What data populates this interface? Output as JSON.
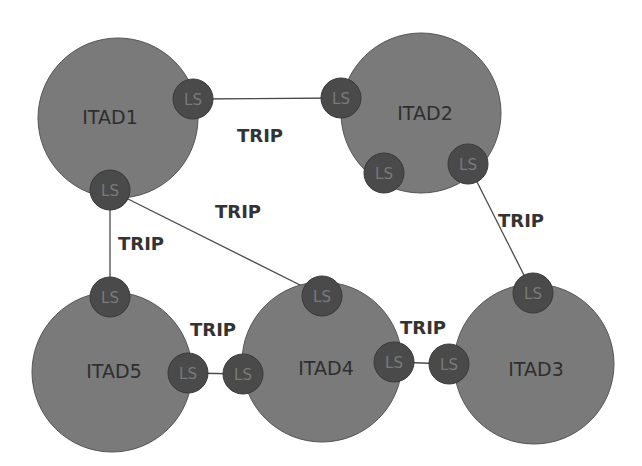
{
  "diagram": {
    "colors": {
      "itad_fill": "#7a7a7a",
      "ls_fill": "#4a4a4a",
      "link": "#4a4a4a",
      "text": "#333333"
    },
    "itads": [
      {
        "id": "itad1",
        "label": "ITAD1",
        "cx": 118,
        "cy": 118,
        "r": 80
      },
      {
        "id": "itad2",
        "label": "ITAD2",
        "cx": 421,
        "cy": 113,
        "r": 80
      },
      {
        "id": "itad3",
        "label": "ITAD3",
        "cx": 534,
        "cy": 364,
        "r": 80
      },
      {
        "id": "itad4",
        "label": "ITAD4",
        "cx": 322,
        "cy": 362,
        "r": 80
      },
      {
        "id": "itad5",
        "label": "ITAD5",
        "cx": 112,
        "cy": 372,
        "r": 80
      }
    ],
    "ls_label": "LS",
    "ls_nodes": [
      {
        "id": "ls1a",
        "itad": "ITAD1",
        "cx": 193,
        "cy": 99
      },
      {
        "id": "ls1b",
        "itad": "ITAD1",
        "cx": 110,
        "cy": 190
      },
      {
        "id": "ls2a",
        "itad": "ITAD2",
        "cx": 341,
        "cy": 98
      },
      {
        "id": "ls2b",
        "itad": "ITAD2",
        "cx": 384,
        "cy": 173
      },
      {
        "id": "ls2c",
        "itad": "ITAD2",
        "cx": 468,
        "cy": 164
      },
      {
        "id": "ls3a",
        "itad": "ITAD3",
        "cx": 533,
        "cy": 293
      },
      {
        "id": "ls3b",
        "itad": "ITAD3",
        "cx": 449,
        "cy": 364
      },
      {
        "id": "ls4a",
        "itad": "ITAD4",
        "cx": 322,
        "cy": 296
      },
      {
        "id": "ls4b",
        "itad": "ITAD4",
        "cx": 243,
        "cy": 374
      },
      {
        "id": "ls4c",
        "itad": "ITAD4",
        "cx": 394,
        "cy": 362
      },
      {
        "id": "ls5a",
        "itad": "ITAD5",
        "cx": 110,
        "cy": 297
      },
      {
        "id": "ls5b",
        "itad": "ITAD5",
        "cx": 188,
        "cy": 373
      }
    ],
    "links": [
      {
        "from": "ls1a",
        "to": "ls2a",
        "label": "TRIP",
        "label_x": 237,
        "label_y": 137
      },
      {
        "from": "ls1b",
        "to": "ls4a",
        "label": "TRIP",
        "label_x": 215,
        "label_y": 213
      },
      {
        "from": "ls1b",
        "to": "ls5a",
        "label": "TRIP",
        "label_x": 118,
        "label_y": 245
      },
      {
        "from": "ls2c",
        "to": "ls3a",
        "label": "TRIP",
        "label_x": 498,
        "label_y": 222
      },
      {
        "from": "ls5b",
        "to": "ls4b",
        "label": "TRIP",
        "label_x": 190,
        "label_y": 331
      },
      {
        "from": "ls4c",
        "to": "ls3b",
        "label": "TRIP",
        "label_x": 400,
        "label_y": 329
      }
    ],
    "trip_label": "TRIP"
  }
}
